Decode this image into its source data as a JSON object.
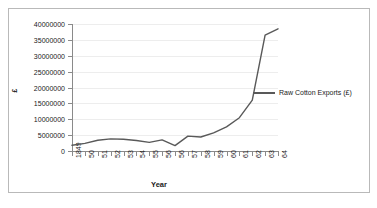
{
  "chart_data": {
    "type": "line",
    "title": "",
    "xlabel": "Year",
    "ylabel": "£",
    "ylim": [
      0,
      40000000
    ],
    "grid": true,
    "legend_position": "right",
    "categories": [
      "1849",
      "50",
      "51",
      "52",
      "53",
      "54",
      "55",
      "56",
      "56",
      "57",
      "58",
      "59",
      "60",
      "61",
      "62",
      "63",
      "64"
    ],
    "y_ticks": [
      "0",
      "5000000",
      "10000000",
      "15000000",
      "20000000",
      "25000000",
      "30000000",
      "35000000",
      "40000000"
    ],
    "y_tick_values": [
      0,
      5000000,
      10000000,
      15000000,
      20000000,
      25000000,
      30000000,
      35000000,
      40000000
    ],
    "series": [
      {
        "name": "Raw Cotton Exports (£)",
        "color": "#595959",
        "values": [
          1800000,
          2400000,
          3400000,
          3800000,
          3700000,
          3300000,
          2700000,
          3500000,
          1700000,
          4700000,
          4400000,
          5700000,
          7600000,
          10500000,
          16000000,
          36500000,
          38500000
        ]
      }
    ]
  },
  "axes": {
    "y_title": "£",
    "x_title": "Year"
  },
  "legend": {
    "entries": [
      {
        "label": "Raw Cotton Exports (£)",
        "color": "#595959"
      }
    ]
  },
  "colors": {
    "series_line": "#595959",
    "gridline": "#ededed",
    "axis": "#8a8a8a",
    "frame_border": "#b9b9b9",
    "background": "#ffffff",
    "text": "#1a1a1a"
  }
}
